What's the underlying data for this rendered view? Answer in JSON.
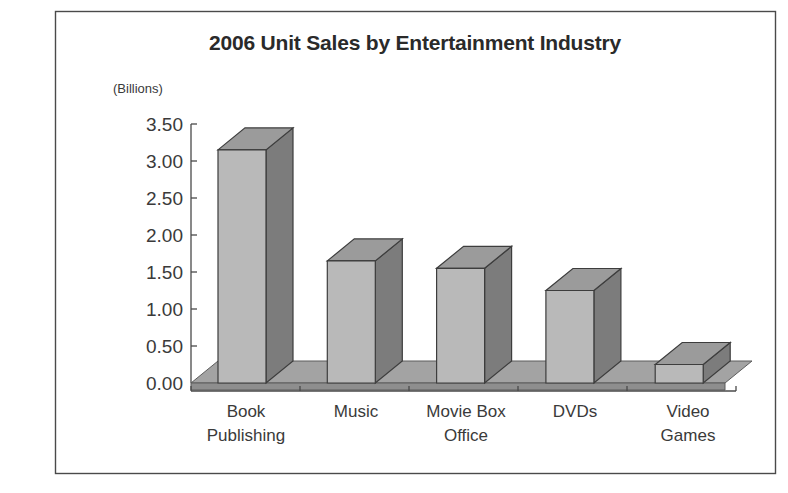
{
  "chart_data": {
    "type": "bar",
    "title": "2006 Unit Sales by Entertainment Industry",
    "xlabel": "",
    "ylabel": "(Billions)",
    "categories": [
      "Book Publishing",
      "Music",
      "Movie Box Office",
      "DVDs",
      "Video Games"
    ],
    "category_lines": [
      [
        "Book",
        "Publishing"
      ],
      [
        "Music",
        ""
      ],
      [
        "Movie Box",
        "Office"
      ],
      [
        "DVDs",
        ""
      ],
      [
        "Video",
        "Games"
      ]
    ],
    "values": [
      3.15,
      1.65,
      1.55,
      1.25,
      0.25
    ],
    "ylim": [
      0.0,
      3.5
    ],
    "ytick_values": [
      3.5,
      3.0,
      2.5,
      2.0,
      1.5,
      1.0,
      0.5,
      0.0
    ],
    "ytick_labels": [
      "3.50",
      "3.00",
      "2.50",
      "2.00",
      "1.50",
      "1.00",
      "0.50",
      "0.00"
    ],
    "grid": false,
    "legend": false,
    "style": "3d-columns",
    "colors": {
      "bar_front": "#b9b9b9",
      "bar_side": "#7c7c7c",
      "bar_top": "#9b9b9b",
      "floor_top": "#a3a3a3",
      "floor_front": "#8e8e8e",
      "outline": "#3d3d3d",
      "axis": "#4a4a4a",
      "text": "#3a3a3a",
      "title_text": "#2a2a2a",
      "background": "#ffffff"
    }
  }
}
